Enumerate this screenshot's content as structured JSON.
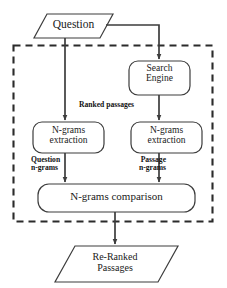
{
  "diagram": {
    "type": "flowchart",
    "boundary": {
      "name": "processing-boundary",
      "style": "dashed"
    },
    "nodes": [
      {
        "id": "question",
        "shape": "parallelogram",
        "role": "input",
        "label": "Question"
      },
      {
        "id": "search-engine",
        "shape": "rounded-rectangle",
        "role": "process",
        "label_line1": "Search",
        "label_line2": "Engine"
      },
      {
        "id": "ngrams-extraction-question",
        "shape": "rounded-rectangle",
        "role": "process",
        "label_line1": "N-grams",
        "label_line2": "extraction"
      },
      {
        "id": "ngrams-extraction-passage",
        "shape": "rounded-rectangle",
        "role": "process",
        "label_line1": "N-grams",
        "label_line2": "extraction"
      },
      {
        "id": "ngrams-comparison",
        "shape": "rounded-rectangle",
        "role": "process",
        "label": "N-grams comparison"
      },
      {
        "id": "re-ranked-passages",
        "shape": "parallelogram",
        "role": "output",
        "label_line1": "Re-Ranked",
        "label_line2": "Passages"
      }
    ],
    "edge_labels": {
      "ranked_passages": "Ranked passages",
      "question_ngrams_line1": "Question",
      "question_ngrams_line2": "n-grams",
      "passage_ngrams_line1": "Passage",
      "passage_ngrams_line2": "n-grams"
    },
    "colors": {
      "stroke": "#3d3d3d",
      "text": "#1a1a1a",
      "background": "#ffffff",
      "boundary": "#2b2b2b"
    }
  }
}
